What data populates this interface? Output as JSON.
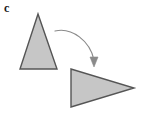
{
  "figure": {
    "panel_label": "c",
    "background_color": "#ffffff",
    "shape_fill_color": "#c6c6c6",
    "shape_stroke_color": "#555555",
    "arrow_color": "#8a8a8a",
    "label_color": "#1a1a1a",
    "shapes": [
      {
        "name": "source-triangle",
        "orientation": "up",
        "points": "38,14 20,69 57,69"
      },
      {
        "name": "target-triangle",
        "orientation": "right",
        "points": "71,69 71,107 134,88"
      }
    ],
    "arrow": {
      "name": "rotation-arrow",
      "path": "M 55 31 C 72 27, 90 41, 94 60",
      "head_points": "94,67 90,57 98,57",
      "start": "55,31",
      "end": "94,67"
    }
  }
}
